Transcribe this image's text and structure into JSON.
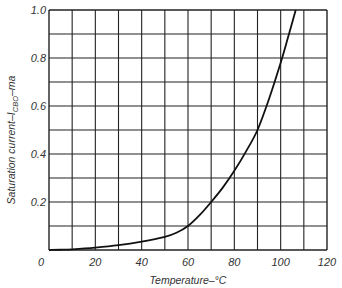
{
  "chart_data": {
    "type": "line",
    "title": "",
    "xlabel": "Temperature–°C",
    "ylabel": {
      "prefix": "Saturation current–I",
      "subscript": "CBO",
      "suffix": "–ma"
    },
    "xlim": [
      0,
      120
    ],
    "ylim": [
      0,
      1.0
    ],
    "grid": true,
    "x_ticks": [
      {
        "value": 0,
        "label": "0"
      },
      {
        "value": 20,
        "label": "20"
      },
      {
        "value": 40,
        "label": "40"
      },
      {
        "value": 60,
        "label": "60"
      },
      {
        "value": 80,
        "label": "80"
      },
      {
        "value": 100,
        "label": "100"
      },
      {
        "value": 120,
        "label": "120"
      }
    ],
    "y_ticks": [
      {
        "value": 0.2,
        "label": "0.2"
      },
      {
        "value": 0.4,
        "label": "0.4"
      },
      {
        "value": 0.6,
        "label": "0.6"
      },
      {
        "value": 0.8,
        "label": "0.8"
      },
      {
        "value": 1.0,
        "label": "1.0"
      }
    ],
    "x_grid_step": 10,
    "y_grid_step": 0.1,
    "series": [
      {
        "name": "I_CBO",
        "x": [
          0,
          5,
          10,
          20,
          30,
          40,
          50,
          55,
          60,
          65,
          70,
          75,
          80,
          85,
          90,
          95,
          100,
          103,
          106.5
        ],
        "values": [
          0.0,
          0.001,
          0.003,
          0.01,
          0.02,
          0.035,
          0.055,
          0.072,
          0.1,
          0.145,
          0.2,
          0.26,
          0.33,
          0.41,
          0.5,
          0.63,
          0.78,
          0.88,
          1.0
        ]
      }
    ]
  },
  "colors": {
    "grid": "#222222",
    "curve": "#111111",
    "text": "#333333"
  }
}
